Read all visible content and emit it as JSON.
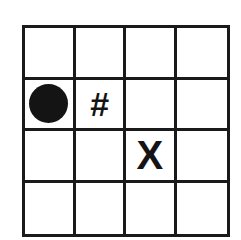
{
  "board": {
    "rows": 4,
    "cols": 4,
    "cells": [
      [
        "",
        "",
        "",
        ""
      ],
      [
        "circle",
        "#",
        "",
        ""
      ],
      [
        "",
        "",
        "X",
        ""
      ],
      [
        "",
        "",
        "",
        ""
      ]
    ]
  },
  "pieces": {
    "player": {
      "row": 1,
      "col": 0,
      "icon": "filled-circle-icon"
    },
    "obstacle": {
      "row": 1,
      "col": 1,
      "label": "#"
    },
    "target": {
      "row": 2,
      "col": 2,
      "label": "X"
    }
  },
  "colors": {
    "grid": "#1a1a1a",
    "piece": "#141414",
    "background": "#ffffff"
  }
}
